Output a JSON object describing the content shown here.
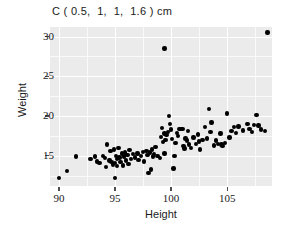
{
  "chart_data": {
    "type": "scatter",
    "title": "C ( 0.5,  1,  1,  1.6 ) cm",
    "xlabel": "Height",
    "ylabel": "Weight",
    "xlim": [
      89.2,
      109.0
    ],
    "ylim": [
      11.2,
      31.2
    ],
    "xticks": [
      90,
      95,
      100,
      105
    ],
    "xtick_labels": [
      "90",
      "95",
      "100",
      "105"
    ],
    "yticks": [
      15,
      20,
      25,
      30
    ],
    "ytick_labels": [
      "15",
      "20",
      "25",
      "30"
    ],
    "grid": true,
    "grid_major_color": "#ffffff",
    "grid_minor_color": "#ffffff",
    "panel_color": "#ebebeb",
    "point_color": "#000000",
    "point_size": 4.4,
    "legend": null,
    "series": [
      {
        "name": "observations",
        "x": [
          90.0,
          90.7,
          91.5,
          92.8,
          93.2,
          93.4,
          93.6,
          93.9,
          94.1,
          94.2,
          94.3,
          94.5,
          94.6,
          94.7,
          94.8,
          94.9,
          95.0,
          95.0,
          95.1,
          95.2,
          95.2,
          95.3,
          95.4,
          95.5,
          95.6,
          95.7,
          95.8,
          95.9,
          96.0,
          96.1,
          96.2,
          96.3,
          96.4,
          96.6,
          96.8,
          97.0,
          97.1,
          97.3,
          97.5,
          97.6,
          97.8,
          97.9,
          98.0,
          98.1,
          98.2,
          98.3,
          98.4,
          98.5,
          98.6,
          98.8,
          99.0,
          99.1,
          99.2,
          99.3,
          99.4,
          99.4,
          99.5,
          99.6,
          99.7,
          99.8,
          99.9,
          100.0,
          100.1,
          100.2,
          100.3,
          100.4,
          100.5,
          100.6,
          100.7,
          100.8,
          100.9,
          101.0,
          101.1,
          101.2,
          101.3,
          101.4,
          101.5,
          101.6,
          101.8,
          102.0,
          102.2,
          102.4,
          102.5,
          102.6,
          102.8,
          103.0,
          103.2,
          103.4,
          103.5,
          103.6,
          103.8,
          104.0,
          104.2,
          104.4,
          104.5,
          104.6,
          104.8,
          105.0,
          105.2,
          105.4,
          105.6,
          105.8,
          106.0,
          106.4,
          106.8,
          107.0,
          107.2,
          107.4,
          107.6,
          107.8,
          108.0,
          108.4,
          99.4,
          108.6
        ],
        "y": [
          12.2,
          13.1,
          14.9,
          14.6,
          14.9,
          14.3,
          14.1,
          15.0,
          14.7,
          13.6,
          16.4,
          14.4,
          15.6,
          14.2,
          13.9,
          15.8,
          14.1,
          12.2,
          15.0,
          14.6,
          13.7,
          16.0,
          14.8,
          14.2,
          15.3,
          13.8,
          14.9,
          15.4,
          14.4,
          15.1,
          14.0,
          15.7,
          14.6,
          15.2,
          14.8,
          15.3,
          14.5,
          15.0,
          15.5,
          14.3,
          15.6,
          15.1,
          12.8,
          15.4,
          13.3,
          15.8,
          14.9,
          15.2,
          16.1,
          15.0,
          14.7,
          17.4,
          18.5,
          16.7,
          17.8,
          15.3,
          17.0,
          17.6,
          18.0,
          20.0,
          19.0,
          18.3,
          17.1,
          13.4,
          15.0,
          16.6,
          17.9,
          17.5,
          18.4,
          18.4,
          18.4,
          18.4,
          16.2,
          15.9,
          17.2,
          16.9,
          18.1,
          16.4,
          16.0,
          17.3,
          16.5,
          17.7,
          16.8,
          15.8,
          17.0,
          18.6,
          17.2,
          20.9,
          18.0,
          19.2,
          16.3,
          16.9,
          16.5,
          17.8,
          16.4,
          16.2,
          16.6,
          20.3,
          17.3,
          18.1,
          18.6,
          17.9,
          18.7,
          18.2,
          19.0,
          18.4,
          18.0,
          18.9,
          20.1,
          18.8,
          18.3,
          18.1,
          28.5,
          30.5
        ]
      }
    ]
  },
  "figure": {
    "background": "#ffffff"
  }
}
